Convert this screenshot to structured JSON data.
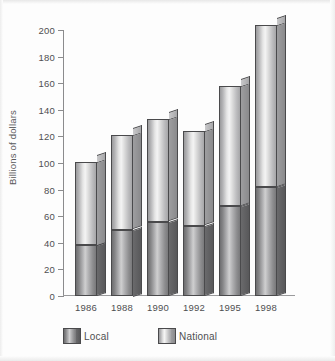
{
  "chart_data": {
    "type": "bar",
    "subtype": "stacked-bar-3d",
    "title": "",
    "xlabel": "",
    "ylabel": "Billions of dollars",
    "categories": [
      "1986",
      "1988",
      "1990",
      "1992",
      "1995",
      "1998"
    ],
    "series": [
      {
        "name": "Local",
        "values": [
          38,
          50,
          56,
          53,
          68,
          82
        ]
      },
      {
        "name": "National",
        "values": [
          63,
          71,
          77,
          71,
          90,
          122
        ]
      }
    ],
    "totals": [
      101,
      121,
      133,
      124,
      158,
      204
    ],
    "ylim": [
      0,
      200
    ],
    "yticks": [
      0,
      20,
      40,
      60,
      80,
      100,
      120,
      140,
      160,
      180,
      200
    ],
    "ytick_labels": [
      "0",
      "20",
      "40",
      "60",
      "80",
      "100",
      "120",
      "140",
      "160",
      "180",
      "200"
    ],
    "grid": false,
    "legend": {
      "position": "bottom",
      "entries": [
        {
          "label": "Local",
          "color": "#9a9a9c"
        },
        {
          "label": "National",
          "color": "#dcdcdc"
        }
      ]
    },
    "colors": {
      "local": "#8d8d8f",
      "national": "#dcdcdc",
      "axis": "#8b8b8d",
      "text": "#4f4f51",
      "background": "#fdfdfd"
    }
  }
}
